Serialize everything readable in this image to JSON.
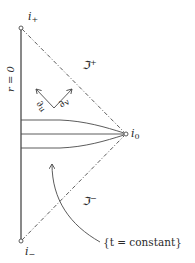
{
  "diagram": {
    "colors": {
      "line": "#4a4a4a",
      "text": "#2a2a2a",
      "background": "#ffffff"
    },
    "nodes": {
      "future_timelike_infinity": {
        "label": "i",
        "sub": "+",
        "x": 21,
        "y": 28
      },
      "past_timelike_infinity": {
        "label": "i",
        "sub": "−",
        "x": 21,
        "y": 241
      },
      "spatial_infinity": {
        "label": "i",
        "sub": "0",
        "x": 126,
        "y": 134
      }
    },
    "edges": {
      "axis": {
        "label": "r = 0",
        "style": "solid"
      },
      "future_null_infinity": {
        "label": "ℑ",
        "sup": "+",
        "style": "dash-dot"
      },
      "past_null_infinity": {
        "label": "ℑ",
        "sup": "−",
        "style": "dash-dot"
      }
    },
    "vectors": [
      {
        "label": "∂",
        "sub": "u",
        "direction": "up-left"
      },
      {
        "label": "∂",
        "sub": "v",
        "direction": "up-right"
      }
    ],
    "surfaces": {
      "count": 3,
      "annotation": "{t = constant}"
    }
  }
}
